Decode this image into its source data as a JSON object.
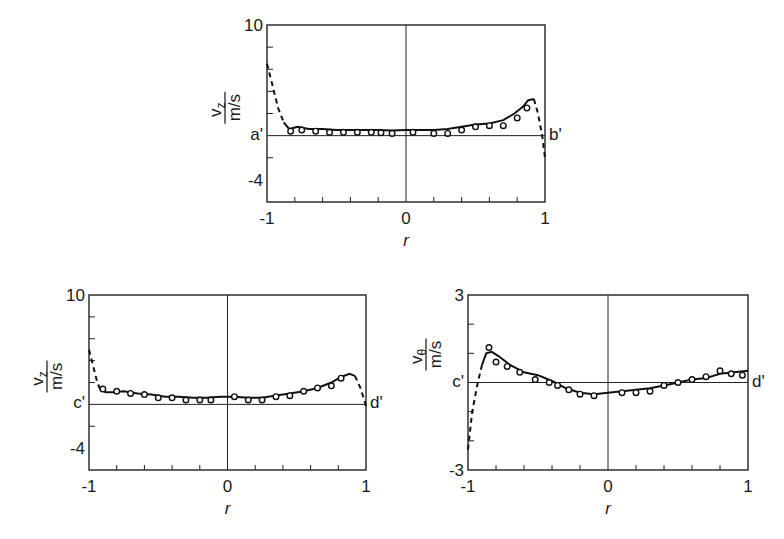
{
  "chart_data": [
    {
      "id": "top",
      "type": "line",
      "title": "",
      "xlabel": "r",
      "ylabel": "v_z / m/s",
      "ylabel_parts": {
        "num": "v",
        "sub": "z",
        "den": "m/s"
      },
      "xlim": [
        -1,
        1
      ],
      "ylim": [
        -6,
        10
      ],
      "ytick_labels": [
        {
          "value": 10,
          "label": "10"
        },
        {
          "value": -4,
          "label": "-4"
        }
      ],
      "xtick_labels": [
        {
          "value": -1,
          "label": "-1"
        },
        {
          "value": 0,
          "label": "0"
        },
        {
          "value": 1,
          "label": "1"
        }
      ],
      "minor_yticks": [
        8,
        6,
        4,
        2,
        -2
      ],
      "minor_xticks": [
        -0.8,
        -0.6,
        -0.4,
        -0.2,
        0.2,
        0.4,
        0.6,
        0.8
      ],
      "left_marker": "a'",
      "right_marker": "b'",
      "grid": false,
      "series": [
        {
          "name": "computed (solid)",
          "style": "solid",
          "x": [
            -0.88,
            -0.84,
            -0.78,
            -0.7,
            -0.6,
            -0.5,
            -0.4,
            -0.3,
            -0.2,
            -0.1,
            0,
            0.1,
            0.2,
            0.3,
            0.4,
            0.5,
            0.6,
            0.7,
            0.78,
            0.84,
            0.88,
            0.92
          ],
          "y": [
            1.2,
            0.6,
            0.8,
            0.6,
            0.6,
            0.5,
            0.5,
            0.5,
            0.5,
            0.45,
            0.5,
            0.5,
            0.5,
            0.6,
            0.8,
            1.0,
            1.1,
            1.4,
            2.0,
            2.6,
            3.2,
            3.3
          ]
        },
        {
          "name": "extrapolated near wall (dashed)",
          "style": "dashed",
          "x": [
            -1.0,
            -0.96,
            -0.92,
            -0.88
          ],
          "y": [
            6.5,
            4.5,
            2.5,
            1.2
          ]
        },
        {
          "name": "extrapolated near wall right (dashed)",
          "style": "dashed",
          "x": [
            0.92,
            0.95,
            0.98,
            1.0
          ],
          "y": [
            3.3,
            2.0,
            0.0,
            -2.0
          ]
        },
        {
          "name": "measured",
          "style": "marker",
          "x": [
            -0.83,
            -0.75,
            -0.65,
            -0.55,
            -0.45,
            -0.35,
            -0.25,
            -0.18,
            -0.1,
            0.05,
            0.2,
            0.3,
            0.4,
            0.5,
            0.6,
            0.7,
            0.8,
            0.87
          ],
          "y": [
            0.4,
            0.5,
            0.4,
            0.3,
            0.3,
            0.3,
            0.3,
            0.25,
            0.2,
            0.3,
            0.2,
            0.2,
            0.5,
            0.8,
            0.9,
            0.9,
            1.6,
            2.5
          ]
        }
      ]
    },
    {
      "id": "bottom-left",
      "type": "line",
      "title": "",
      "xlabel": "r",
      "ylabel": "v_z / m/s",
      "ylabel_parts": {
        "num": "v",
        "sub": "z",
        "den": "m/s"
      },
      "xlim": [
        -1,
        1
      ],
      "ylim": [
        -6,
        10
      ],
      "ytick_labels": [
        {
          "value": 10,
          "label": "10"
        },
        {
          "value": -4,
          "label": "-4"
        }
      ],
      "xtick_labels": [
        {
          "value": -1,
          "label": "-1"
        },
        {
          "value": 0,
          "label": "0"
        },
        {
          "value": 1,
          "label": "1"
        }
      ],
      "minor_yticks": [
        8,
        6,
        4,
        2,
        -2
      ],
      "minor_xticks": [
        -0.8,
        -0.6,
        -0.4,
        -0.2,
        0.2,
        0.4,
        0.6,
        0.8
      ],
      "left_marker": "c'",
      "right_marker": "d'",
      "grid": false,
      "series": [
        {
          "name": "computed (solid)",
          "style": "solid",
          "x": [
            -0.92,
            -0.88,
            -0.82,
            -0.75,
            -0.65,
            -0.55,
            -0.45,
            -0.35,
            -0.25,
            -0.15,
            -0.05,
            0.05,
            0.15,
            0.25,
            0.35,
            0.45,
            0.55,
            0.65,
            0.75,
            0.82,
            0.88,
            0.92
          ],
          "y": [
            1.4,
            1.1,
            1.1,
            1.2,
            1.0,
            0.9,
            0.7,
            0.7,
            0.6,
            0.6,
            0.7,
            0.7,
            0.6,
            0.6,
            0.8,
            1.0,
            1.2,
            1.5,
            2.0,
            2.5,
            2.8,
            2.6
          ]
        },
        {
          "name": "extrapolated near wall (dashed)",
          "style": "dashed",
          "x": [
            -1.0,
            -0.97,
            -0.94,
            -0.92
          ],
          "y": [
            5.0,
            3.5,
            2.0,
            1.4
          ]
        },
        {
          "name": "extrapolated near wall right (dashed)",
          "style": "dashed",
          "x": [
            0.92,
            0.96,
            0.99,
            1.0
          ],
          "y": [
            2.6,
            1.5,
            0.3,
            -0.2
          ]
        },
        {
          "name": "measured",
          "style": "marker",
          "x": [
            -0.9,
            -0.8,
            -0.7,
            -0.6,
            -0.5,
            -0.4,
            -0.3,
            -0.2,
            -0.12,
            0.05,
            0.15,
            0.25,
            0.35,
            0.45,
            0.55,
            0.65,
            0.75,
            0.82
          ],
          "y": [
            1.4,
            1.2,
            1.0,
            0.9,
            0.6,
            0.6,
            0.4,
            0.4,
            0.4,
            0.7,
            0.4,
            0.4,
            0.7,
            0.8,
            1.2,
            1.5,
            1.7,
            2.4
          ]
        }
      ]
    },
    {
      "id": "bottom-right",
      "type": "line",
      "title": "",
      "xlabel": "r",
      "ylabel": "v_θ / m/s",
      "ylabel_parts": {
        "num": "v",
        "sub": "θ",
        "den": "m/s"
      },
      "xlim": [
        -1,
        1
      ],
      "ylim": [
        -3,
        3
      ],
      "ytick_labels": [
        {
          "value": 3,
          "label": "3"
        },
        {
          "value": -3,
          "label": "-3"
        }
      ],
      "xtick_labels": [
        {
          "value": -1,
          "label": "-1"
        },
        {
          "value": 0,
          "label": "0"
        },
        {
          "value": 1,
          "label": "1"
        }
      ],
      "minor_yticks": [
        2,
        1,
        -1,
        -2
      ],
      "minor_xticks": [
        -0.8,
        -0.6,
        -0.4,
        -0.2,
        0.2,
        0.4,
        0.6,
        0.8
      ],
      "left_marker": "c'",
      "right_marker": "d'",
      "grid": false,
      "series": [
        {
          "name": "computed (solid)",
          "style": "solid",
          "x": [
            -0.9,
            -0.87,
            -0.83,
            -0.78,
            -0.7,
            -0.6,
            -0.5,
            -0.4,
            -0.3,
            -0.2,
            -0.1,
            0,
            0.1,
            0.2,
            0.3,
            0.4,
            0.5,
            0.6,
            0.7,
            0.8,
            0.9,
            1.0
          ],
          "y": [
            0.6,
            1.0,
            1.05,
            0.9,
            0.6,
            0.35,
            0.25,
            0.05,
            -0.2,
            -0.35,
            -0.4,
            -0.35,
            -0.3,
            -0.25,
            -0.2,
            -0.1,
            0.0,
            0.1,
            0.15,
            0.3,
            0.35,
            0.4
          ]
        },
        {
          "name": "extrapolated near wall (dashed)",
          "style": "dashed",
          "x": [
            -1.0,
            -0.97,
            -0.93,
            -0.9
          ],
          "y": [
            -2.3,
            -1.0,
            0.0,
            0.6
          ]
        },
        {
          "name": "measured",
          "style": "marker",
          "x": [
            -0.85,
            -0.8,
            -0.72,
            -0.63,
            -0.52,
            -0.42,
            -0.36,
            -0.28,
            -0.2,
            -0.1,
            0.1,
            0.2,
            0.3,
            0.4,
            0.5,
            0.6,
            0.7,
            0.8,
            0.88,
            0.96
          ],
          "y": [
            1.2,
            0.7,
            0.55,
            0.35,
            0.1,
            0.0,
            -0.1,
            -0.25,
            -0.4,
            -0.45,
            -0.35,
            -0.35,
            -0.3,
            -0.1,
            0.0,
            0.1,
            0.2,
            0.4,
            0.3,
            0.25
          ]
        }
      ]
    }
  ],
  "caption_fragment": ""
}
